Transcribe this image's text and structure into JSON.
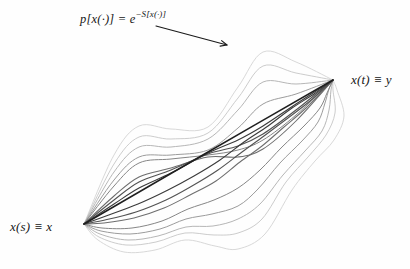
{
  "figure": {
    "background": "#fefefe",
    "formula": {
      "base": "p[x(·)] = e",
      "exponent": "−S[x(·)]"
    },
    "start_label": "x(s) ≡ x",
    "end_label": "x(t) ≡ y",
    "arrow": {
      "x1": 156,
      "y1": 26,
      "x2": 227,
      "y2": 45,
      "color": "#1a1a1a",
      "width": 1.1,
      "head_size": 7
    },
    "endpoints": {
      "start": {
        "x": 84,
        "y": 224
      },
      "end": {
        "x": 333,
        "y": 80
      }
    },
    "classical_path": {
      "name": "classical-path-line",
      "color": "#1f1f1f",
      "width": 1.5,
      "points": [
        [
          84,
          224
        ],
        [
          208,
          152
        ],
        [
          333,
          80
        ]
      ]
    },
    "paths": [
      {
        "color": "#d4d4d4",
        "width": 0.9,
        "points": [
          [
            84,
            224
          ],
          [
            114,
            155
          ],
          [
            139,
            126
          ],
          [
            171,
            129
          ],
          [
            208,
            127
          ],
          [
            238,
            87
          ],
          [
            263,
            52
          ],
          [
            296,
            62
          ],
          [
            333,
            80
          ]
        ]
      },
      {
        "color": "#d4d4d4",
        "width": 0.9,
        "points": [
          [
            84,
            224
          ],
          [
            98,
            240
          ],
          [
            124,
            252
          ],
          [
            155,
            250
          ],
          [
            185,
            240
          ],
          [
            215,
            246
          ],
          [
            238,
            249
          ],
          [
            265,
            234
          ],
          [
            292,
            190
          ],
          [
            315,
            161
          ],
          [
            334,
            140
          ],
          [
            344,
            116
          ],
          [
            337,
            90
          ],
          [
            333,
            80
          ]
        ]
      },
      {
        "color": "#c6c6c6",
        "width": 0.9,
        "points": [
          [
            84,
            224
          ],
          [
            114,
            164
          ],
          [
            139,
            137
          ],
          [
            171,
            139
          ],
          [
            208,
            133
          ],
          [
            238,
            98
          ],
          [
            263,
            66
          ],
          [
            296,
            73
          ],
          [
            333,
            80
          ]
        ]
      },
      {
        "color": "#c6c6c6",
        "width": 0.9,
        "points": [
          [
            84,
            224
          ],
          [
            99,
            237
          ],
          [
            126,
            245
          ],
          [
            156,
            242
          ],
          [
            185,
            233
          ],
          [
            214,
            235
          ],
          [
            238,
            233
          ],
          [
            262,
            219
          ],
          [
            286,
            182
          ],
          [
            308,
            157
          ],
          [
            326,
            135
          ],
          [
            335,
            113
          ],
          [
            333,
            90
          ],
          [
            333,
            80
          ]
        ]
      },
      {
        "color": "#b2b2b2",
        "width": 0.95,
        "points": [
          [
            84,
            224
          ],
          [
            114,
            172
          ],
          [
            139,
            147
          ],
          [
            171,
            147
          ],
          [
            208,
            139
          ],
          [
            238,
            110
          ],
          [
            263,
            82
          ],
          [
            296,
            84
          ],
          [
            333,
            80
          ]
        ]
      },
      {
        "color": "#b2b2b2",
        "width": 0.95,
        "points": [
          [
            84,
            224
          ],
          [
            100,
            234
          ],
          [
            128,
            240
          ],
          [
            158,
            236
          ],
          [
            186,
            227
          ],
          [
            213,
            226
          ],
          [
            238,
            219
          ],
          [
            260,
            204
          ],
          [
            283,
            175
          ],
          [
            305,
            151
          ],
          [
            322,
            131
          ],
          [
            329,
            110
          ],
          [
            331,
            90
          ],
          [
            333,
            80
          ]
        ]
      },
      {
        "color": "#9c9c9c",
        "width": 1.0,
        "points": [
          [
            84,
            224
          ],
          [
            114,
            180
          ],
          [
            139,
            157
          ],
          [
            171,
            155
          ],
          [
            208,
            150
          ],
          [
            238,
            128
          ],
          [
            263,
            104
          ],
          [
            296,
            94
          ],
          [
            333,
            80
          ]
        ]
      },
      {
        "color": "#9c9c9c",
        "width": 1.0,
        "points": [
          [
            84,
            224
          ],
          [
            101,
            231
          ],
          [
            130,
            234
          ],
          [
            160,
            229
          ],
          [
            186,
            219
          ],
          [
            212,
            214
          ],
          [
            238,
            206
          ],
          [
            258,
            189
          ],
          [
            280,
            163
          ],
          [
            302,
            141
          ],
          [
            318,
            122
          ],
          [
            325,
            103
          ],
          [
            329,
            89
          ],
          [
            333,
            80
          ]
        ]
      },
      {
        "color": "#868686",
        "width": 1.0,
        "points": [
          [
            84,
            224
          ],
          [
            114,
            186
          ],
          [
            139,
            163
          ],
          [
            171,
            159
          ],
          [
            208,
            155
          ],
          [
            238,
            150
          ],
          [
            263,
            140
          ],
          [
            296,
            115
          ],
          [
            333,
            80
          ]
        ]
      },
      {
        "color": "#868686",
        "width": 1.0,
        "points": [
          [
            84,
            224
          ],
          [
            102,
            228
          ],
          [
            132,
            228
          ],
          [
            162,
            221
          ],
          [
            188,
            209
          ],
          [
            214,
            200
          ],
          [
            238,
            188
          ],
          [
            260,
            170
          ],
          [
            282,
            147
          ],
          [
            304,
            126
          ],
          [
            320,
            108
          ],
          [
            327,
            93
          ],
          [
            333,
            80
          ]
        ]
      },
      {
        "color": "#6e6e6e",
        "width": 1.05,
        "points": [
          [
            84,
            224
          ],
          [
            114,
            196
          ],
          [
            139,
            177
          ],
          [
            171,
            168
          ],
          [
            208,
            157
          ],
          [
            238,
            157
          ],
          [
            263,
            149
          ],
          [
            296,
            121
          ],
          [
            333,
            80
          ]
        ]
      },
      {
        "color": "#6e6e6e",
        "width": 1.05,
        "points": [
          [
            84,
            224
          ],
          [
            104,
            223
          ],
          [
            134,
            218
          ],
          [
            164,
            208
          ],
          [
            190,
            195
          ],
          [
            216,
            181
          ],
          [
            240,
            162
          ],
          [
            262,
            146
          ],
          [
            284,
            127
          ],
          [
            306,
            108
          ],
          [
            333,
            80
          ]
        ]
      },
      {
        "color": "#525252",
        "width": 1.1,
        "points": [
          [
            84,
            224
          ],
          [
            114,
            200
          ],
          [
            139,
            182
          ],
          [
            171,
            170
          ],
          [
            208,
            154
          ],
          [
            238,
            146
          ],
          [
            263,
            134
          ],
          [
            296,
            110
          ],
          [
            333,
            80
          ]
        ]
      },
      {
        "color": "#525252",
        "width": 1.1,
        "points": [
          [
            84,
            224
          ],
          [
            105,
            220
          ],
          [
            136,
            212
          ],
          [
            166,
            200
          ],
          [
            192,
            186
          ],
          [
            218,
            170
          ],
          [
            242,
            152
          ],
          [
            264,
            136
          ],
          [
            288,
            118
          ],
          [
            310,
            101
          ],
          [
            333,
            80
          ]
        ]
      },
      {
        "color": "#3a3a3a",
        "width": 1.1,
        "points": [
          [
            84,
            224
          ],
          [
            114,
            204
          ],
          [
            139,
            188
          ],
          [
            171,
            173
          ],
          [
            208,
            153
          ],
          [
            238,
            140
          ],
          [
            263,
            126
          ],
          [
            296,
            104
          ],
          [
            333,
            80
          ]
        ]
      },
      {
        "color": "#3a3a3a",
        "width": 1.1,
        "points": [
          [
            84,
            224
          ],
          [
            106,
            216
          ],
          [
            138,
            204
          ],
          [
            168,
            190
          ],
          [
            194,
            176
          ],
          [
            220,
            160
          ],
          [
            244,
            142
          ],
          [
            268,
            126
          ],
          [
            292,
            108
          ],
          [
            314,
            94
          ],
          [
            333,
            80
          ]
        ]
      }
    ]
  }
}
